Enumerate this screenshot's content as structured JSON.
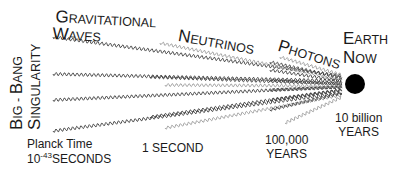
{
  "diagram": {
    "labels": {
      "gravitational_waves": {
        "line1": {
          "first": "G",
          "rest": "RAVITATIONAL"
        },
        "line2": {
          "first": "W",
          "rest": "AVES"
        }
      },
      "neutrinos": {
        "first": "N",
        "rest": "EUTRINOS"
      },
      "photons": {
        "first": "P",
        "rest": "HOTONS"
      },
      "earth_now": {
        "line1": {
          "first": "E",
          "rest": "ARTH"
        },
        "line2": {
          "first": "N",
          "rest": "OW"
        }
      },
      "big_bang": {
        "line1": {
          "first": "B",
          "rest": "IG - ",
          "first2": "B",
          "rest2": "ANG"
        },
        "line2": {
          "first": "S",
          "rest": "INGULARITY"
        }
      }
    },
    "time_marks": {
      "planck": {
        "line1": "Planck Time",
        "base": "10",
        "exponent": "-43",
        "unit": "SECONDS"
      },
      "one_second": "1 SECOND",
      "hundred_thousand": {
        "line1": "100,000",
        "line2": "YEARS"
      },
      "ten_billion": {
        "line1": "10 billion",
        "line2": "YEARS"
      }
    },
    "colors": {
      "wave": "#3a3a3a",
      "wave_light": "#9a9a9a",
      "earth": "#000000",
      "text": "#1a1a1a"
    }
  }
}
